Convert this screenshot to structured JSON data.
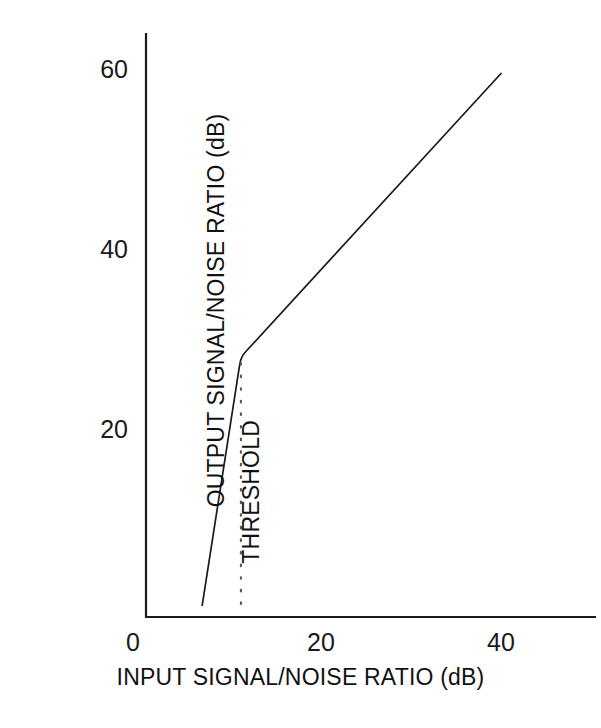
{
  "chart_data": {
    "type": "line",
    "title": "",
    "xlabel": "INPUT SIGNAL/NOISE RATIO (dB)",
    "ylabel": "OUTPUT SIGNAL/NOISE RATIO (dB)",
    "xlim": [
      0,
      44
    ],
    "ylim": [
      0,
      64
    ],
    "xticks": [
      0,
      20,
      40
    ],
    "xtick_labels": [
      "0",
      "20",
      "40"
    ],
    "yticks": [
      20,
      40,
      60
    ],
    "ytick_labels": [
      "20",
      "40",
      "60"
    ],
    "grid": false,
    "legend": null,
    "series": [
      {
        "name": "output signal/noise ratio",
        "style": "solid",
        "color": "#1a1a1a",
        "x": [
          6.8,
          11.1,
          40.0
        ],
        "y": [
          0.4,
          28.0,
          59.5
        ]
      }
    ],
    "annotations": [
      {
        "name": "threshold",
        "text": "THRESHOLD",
        "style": "dotted-vertical-line",
        "x": 11.1,
        "y_from": 0.0,
        "y_to": 28.0,
        "color": "#555555",
        "label_rotation": -90
      }
    ],
    "axis_color": "#1a1a1a",
    "background_color": "#ffffff"
  },
  "axes": {
    "x_title": "INPUT SIGNAL/NOISE RATIO (dB)",
    "y_title": "OUTPUT SIGNAL/NOISE RATIO (dB)",
    "x_tick_0": "0",
    "x_tick_1": "20",
    "x_tick_2": "40",
    "y_tick_0": "20",
    "y_tick_1": "40",
    "y_tick_2": "60"
  },
  "annotation": {
    "threshold_label": "THRESHOLD"
  },
  "colors": {
    "line": "#1a1a1a",
    "axis": "#1a1a1a",
    "dotted": "#555555",
    "text": "#111111",
    "background": "#ffffff"
  }
}
